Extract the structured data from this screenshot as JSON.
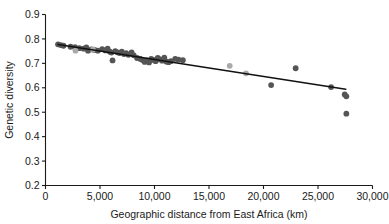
{
  "chart_data": {
    "type": "scatter",
    "title": "",
    "xlabel": "Geographic distance from East Africa (km)",
    "ylabel": "Genetic diversity",
    "xlim": [
      0,
      30000
    ],
    "ylim": [
      0.2,
      0.9
    ],
    "xticks": [
      0,
      5000,
      10000,
      15000,
      20000,
      25000,
      30000
    ],
    "xticklabels": [
      "0",
      "5,000",
      "10,000",
      "15,000",
      "20,000",
      "25,000",
      "30,000"
    ],
    "yticks": [
      0.2,
      0.3,
      0.4,
      0.5,
      0.6,
      0.7,
      0.8,
      0.9
    ],
    "yticklabels": [
      "0.2",
      "0.3",
      "0.4",
      "0.5",
      "0.6",
      "0.7",
      "0.8",
      "0.9"
    ],
    "grid": false,
    "legend": "none",
    "marker_size_px": 5,
    "colors": {
      "point_dark": "#555555",
      "point_light": "#aaaaaa",
      "trendline": "#111111",
      "axis": "#1a1a1a",
      "background": "#ffffff"
    },
    "series": [
      {
        "name": "populations-dark",
        "color": "#555555",
        "points": [
          [
            1150,
            0.778
          ],
          [
            1400,
            0.775
          ],
          [
            1650,
            0.772
          ],
          [
            2300,
            0.768
          ],
          [
            2700,
            0.766
          ],
          [
            3100,
            0.762
          ],
          [
            3500,
            0.76
          ],
          [
            3750,
            0.765
          ],
          [
            3900,
            0.752
          ],
          [
            4200,
            0.757
          ],
          [
            4500,
            0.755
          ],
          [
            4800,
            0.752
          ],
          [
            5200,
            0.758
          ],
          [
            5500,
            0.753
          ],
          [
            5700,
            0.76
          ],
          [
            5900,
            0.748
          ],
          [
            6050,
            0.744
          ],
          [
            6150,
            0.712
          ],
          [
            6400,
            0.75
          ],
          [
            6600,
            0.745
          ],
          [
            6800,
            0.742
          ],
          [
            7000,
            0.748
          ],
          [
            7200,
            0.738
          ],
          [
            7400,
            0.742
          ],
          [
            7600,
            0.735
          ],
          [
            7900,
            0.745
          ],
          [
            8100,
            0.733
          ],
          [
            8400,
            0.722
          ],
          [
            8700,
            0.718
          ],
          [
            8900,
            0.714
          ],
          [
            9100,
            0.706
          ],
          [
            9300,
            0.712
          ],
          [
            9500,
            0.704
          ],
          [
            9700,
            0.718
          ],
          [
            9900,
            0.714
          ],
          [
            10100,
            0.709
          ],
          [
            10300,
            0.722
          ],
          [
            10500,
            0.716
          ],
          [
            10700,
            0.711
          ],
          [
            10900,
            0.723
          ],
          [
            11100,
            0.707
          ],
          [
            11300,
            0.705
          ],
          [
            11500,
            0.709
          ],
          [
            11900,
            0.718
          ],
          [
            12200,
            0.715
          ],
          [
            12600,
            0.713
          ],
          [
            20700,
            0.611
          ],
          [
            22950,
            0.68
          ],
          [
            26200,
            0.603
          ],
          [
            27450,
            0.573
          ],
          [
            27600,
            0.565
          ],
          [
            27600,
            0.494
          ]
        ]
      },
      {
        "name": "populations-light",
        "color": "#aaaaaa",
        "points": [
          [
            2750,
            0.752
          ],
          [
            4350,
            0.757
          ],
          [
            16900,
            0.69
          ],
          [
            18400,
            0.659
          ]
        ]
      }
    ],
    "trendline": {
      "name": "linear-fit",
      "color": "#111111",
      "x_start": 1150,
      "y_start": 0.777,
      "x_end": 27550,
      "y_end": 0.594
    }
  }
}
